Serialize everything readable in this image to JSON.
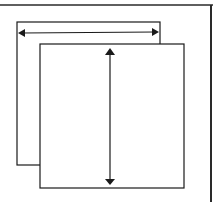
{
  "diagram": {
    "colors": {
      "stroke": "#1a1a1a",
      "frame": "#2a2a2a",
      "background": "#ffffff"
    },
    "back_sheet": {
      "x": 17,
      "y": 22,
      "w": 143,
      "h": 143
    },
    "front_sheet": {
      "x": 40,
      "y": 44,
      "w": 144,
      "h": 144
    },
    "width_arrow": {
      "x1": 19,
      "x2": 158,
      "y": 33
    },
    "height_arrow": {
      "x": 110,
      "y1": 49,
      "y2": 184
    }
  }
}
